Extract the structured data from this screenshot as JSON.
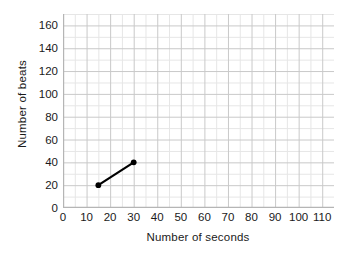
{
  "chart_data": {
    "type": "line",
    "title": "",
    "xlabel": "Number of seconds",
    "ylabel": "Number of beats",
    "xlim": [
      0,
      115
    ],
    "ylim": [
      0,
      170
    ],
    "xticks": [
      0,
      10,
      20,
      30,
      40,
      50,
      60,
      70,
      80,
      90,
      100,
      110
    ],
    "yticks": [
      0,
      20,
      40,
      60,
      80,
      100,
      120,
      140,
      160
    ],
    "x_minor_step": 5,
    "y_minor_step": 10,
    "grid": true,
    "legend": false,
    "series": [
      {
        "name": "heart rate",
        "x": [
          15,
          30
        ],
        "values": [
          20,
          40
        ],
        "color": "#000000",
        "marker": "circle",
        "line_width": 2.2
      }
    ],
    "points": [
      {
        "x": 15,
        "y": 20
      },
      {
        "x": 30,
        "y": 40
      }
    ],
    "colors": {
      "background": "#ffffff",
      "grid_major": "#c9c9c9",
      "grid_minor": "#e6e6e6",
      "axis": "#b5b5b5",
      "text": "#1a1a1a",
      "series": "#000000"
    }
  },
  "axes": {
    "y_title": "Number of beats",
    "x_title": "Number of seconds",
    "y_tick_labels": [
      "160",
      "140",
      "120",
      "100",
      "80",
      "60",
      "40",
      "20",
      "0"
    ],
    "x_tick_labels": [
      "0",
      "10",
      "20",
      "30",
      "40",
      "50",
      "60",
      "70",
      "80",
      "90",
      "100",
      "110"
    ]
  }
}
